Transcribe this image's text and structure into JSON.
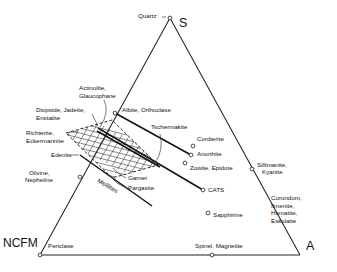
{
  "chart_data": {
    "type": "scatter",
    "title": "",
    "subtitle": "",
    "xlabel": "",
    "ylabel": "",
    "plot_kind": "ternary-diagram",
    "grid": false,
    "legend_position": "none",
    "apices": [
      {
        "name": "S",
        "label": "S",
        "x": 170,
        "y": 18
      },
      {
        "name": "A",
        "label": "A",
        "x": 300,
        "y": 255
      },
      {
        "name": "NCFM",
        "label": "NCFM",
        "x": 40,
        "y": 255
      }
    ],
    "axis_ranges": {
      "note": "composition ternary, unscaled"
    },
    "points": [
      {
        "label": "Quartz",
        "x": 170,
        "y": 18,
        "lx": 138,
        "ly": 18,
        "anchor": "start",
        "marker": true
      },
      {
        "label": "Albite, Orthoclase",
        "x": 115,
        "y": 113,
        "lx": 122,
        "ly": 112,
        "anchor": "start",
        "marker": true
      },
      {
        "label": "Cordierite",
        "x": 193,
        "y": 146,
        "lx": 197,
        "ly": 141,
        "anchor": "start",
        "marker": true
      },
      {
        "label": "Anorthite",
        "x": 191,
        "y": 155,
        "lx": 197,
        "ly": 156,
        "anchor": "start",
        "marker": true
      },
      {
        "label": "Zoisite, Epidote",
        "x": 185,
        "y": 163,
        "lx": 190,
        "ly": 170,
        "anchor": "start",
        "marker": true
      },
      {
        "label": "Sillimanite,",
        "x": 252,
        "y": 169,
        "lx": 257,
        "ly": 167,
        "anchor": "start",
        "marker": true
      },
      {
        "label": "Kyanite",
        "x": 252,
        "y": 169,
        "lx": 262,
        "ly": 174,
        "anchor": "start",
        "marker": false
      },
      {
        "label": "CATS",
        "x": 203,
        "y": 190,
        "lx": 208,
        "ly": 192,
        "anchor": "start",
        "marker": true
      },
      {
        "label": "Sapphirine",
        "x": 208,
        "y": 213,
        "lx": 213,
        "ly": 217,
        "anchor": "start",
        "marker": true
      },
      {
        "label": "Periclase",
        "x": 40,
        "y": 255,
        "lx": 48,
        "ly": 248,
        "anchor": "start",
        "marker": true
      },
      {
        "label": "Spinel, Magnetite",
        "x": 212,
        "y": 255,
        "lx": 195,
        "ly": 248,
        "anchor": "start",
        "marker": true
      },
      {
        "label": "Olivine,",
        "x": 80,
        "y": 177,
        "lx": 29,
        "ly": 175,
        "anchor": "start",
        "marker": true
      },
      {
        "label": "Nepheline",
        "x": 80,
        "y": 177,
        "lx": 25,
        "ly": 182,
        "anchor": "start",
        "marker": false
      }
    ],
    "field_labels": [
      {
        "name": "actinolite-glaucophane",
        "lines": [
          "Actinolite,",
          "Glaucophane"
        ],
        "lx": 79,
        "ly": 90,
        "anchor": "start"
      },
      {
        "name": "diopside-jadeite-enstatite",
        "lines": [
          "Diopside, Jadeite,",
          "Enstatite"
        ],
        "lx": 36,
        "ly": 112,
        "anchor": "start"
      },
      {
        "name": "richterite-eckermannite",
        "lines": [
          "Richterite,",
          "Eckermannite"
        ],
        "lx": 26,
        "ly": 135,
        "anchor": "start"
      },
      {
        "name": "edenite",
        "lines": [
          "Edenite"
        ],
        "lx": 51,
        "ly": 157,
        "anchor": "start"
      },
      {
        "name": "tschermakite",
        "lines": [
          "Tschermakite"
        ],
        "lx": 151,
        "ly": 129,
        "anchor": "start"
      },
      {
        "name": "garnet",
        "lines": [
          "Garnet"
        ],
        "lx": 128,
        "ly": 180,
        "anchor": "start"
      },
      {
        "name": "pargasite",
        "lines": [
          "Pargasite"
        ],
        "lx": 128,
        "ly": 190,
        "anchor": "start"
      },
      {
        "name": "melilites",
        "lines": [
          "Melilites"
        ],
        "lx": 97,
        "ly": 182,
        "anchor": "start",
        "rotate": 30
      },
      {
        "name": "corundum-group",
        "lines": [
          "Corundum,",
          "Ilmenite,",
          "Hematite,",
          "Eskolaite"
        ],
        "lx": 271,
        "ly": 200,
        "anchor": "start"
      }
    ],
    "apex_labels": {
      "top": "S",
      "bottom_left": "NCFM",
      "bottom_right": "A"
    }
  },
  "figure": {
    "caption": "",
    "background": "#ffffff",
    "line_color": "#222222",
    "text_color": "#111111"
  }
}
